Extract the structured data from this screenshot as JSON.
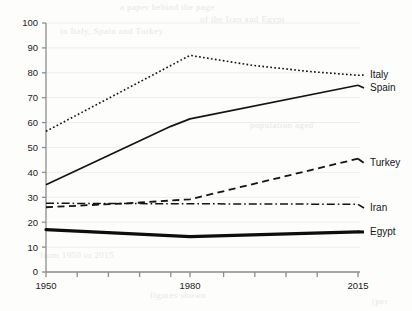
{
  "chart_data": {
    "type": "line",
    "title": "",
    "subtitle": "",
    "xlabel": "",
    "ylabel": "",
    "xlim": [
      1950,
      2015
    ],
    "ylim": [
      0,
      100
    ],
    "grid": true,
    "legend_position": "right-inline-labels",
    "y_ticks": [
      "0",
      "10",
      "20",
      "30",
      "40",
      "50",
      "60",
      "70",
      "80",
      "90",
      "100"
    ],
    "y_tick_values": [
      0,
      10,
      20,
      30,
      40,
      50,
      60,
      70,
      80,
      90,
      100
    ],
    "x_ticks": [
      "1950",
      "",
      "",
      "",
      "",
      "1980",
      "",
      "",
      "",
      "",
      "2015"
    ],
    "x_tick_labels_shown": [
      "1950",
      "1980",
      "2015"
    ],
    "x_tick_values": [
      1950,
      1956.5,
      1963,
      1969.5,
      1976,
      1980,
      1987,
      1993.5,
      2000,
      2006.5,
      2015
    ],
    "series": [
      {
        "name": "Italy",
        "style": "dotted",
        "width": 1.6,
        "color": "#141414",
        "x": [
          1950,
          1980,
          1993,
          2005,
          2015
        ],
        "values": [
          56.5,
          87,
          83,
          80.5,
          79
        ]
      },
      {
        "name": "Spain",
        "style": "solid",
        "width": 1.7,
        "color": "#141414",
        "x": [
          1950,
          1976,
          1980,
          2015
        ],
        "values": [
          35,
          58.5,
          61.5,
          75
        ]
      },
      {
        "name": "Turkey",
        "style": "dashed",
        "width": 1.8,
        "color": "#141414",
        "x": [
          1950,
          1969,
          1980,
          2015
        ],
        "values": [
          26,
          27.8,
          29.2,
          45.5
        ]
      },
      {
        "name": "Iran",
        "style": "dash-dot",
        "width": 1.5,
        "color": "#141414",
        "x": [
          1950,
          1980,
          2015
        ],
        "values": [
          27.6,
          27.4,
          27.2
        ]
      },
      {
        "name": "Egypt",
        "style": "solid-thick",
        "width": 3.2,
        "color": "#0d0d0d",
        "x": [
          1950,
          1980,
          2015
        ],
        "values": [
          17,
          14.2,
          16.1
        ]
      }
    ],
    "series_labels": [
      {
        "name": "Italy",
        "value_at_end": 79
      },
      {
        "name": "Spain",
        "value_at_end": 75
      },
      {
        "name": "Turkey",
        "value_at_end": 45.5
      },
      {
        "name": "Iran",
        "value_at_end": 27.2
      },
      {
        "name": "Egypt",
        "value_at_end": 16.1
      }
    ]
  },
  "axes": {
    "axis_color": "#8d8d8d",
    "grid_color": "#ededed",
    "tick_text_color": "#1b1b1b"
  },
  "background_bleed": [
    "a paper behind the page",
    "in Italy, Spain and Turkey",
    "of the Iran and Egypt",
    "population aged",
    "from 1950 to 2015",
    "figures shown",
    "(per"
  ]
}
